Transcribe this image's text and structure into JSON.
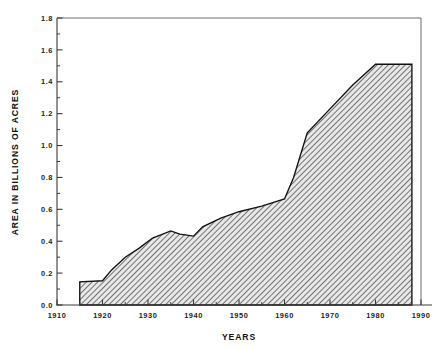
{
  "chart_data": {
    "type": "area",
    "title": "",
    "xlabel": "YEARS",
    "ylabel": "AREA IN BILLIONS OF ACRES",
    "xlim": [
      1910,
      1990
    ],
    "ylim": [
      0.0,
      1.8
    ],
    "grid": false,
    "legend": null,
    "x_ticks": [
      1910,
      1920,
      1930,
      1940,
      1950,
      1960,
      1970,
      1980,
      1990
    ],
    "x_tick_labels": [
      "1910",
      "1920",
      "1930",
      "1940",
      "1950",
      "1960",
      "1970",
      "1980",
      "1990"
    ],
    "x_minor_tick_step": 5,
    "y_ticks": [
      0.0,
      0.2,
      0.4,
      0.6,
      0.8,
      1.0,
      1.2,
      1.4,
      1.6,
      1.8
    ],
    "y_tick_labels": [
      "0.0",
      "0.2",
      "0.4",
      "0.6",
      "0.8",
      "1.0",
      "1.2",
      "1.4",
      "1.6",
      "1.8"
    ],
    "y_minor_tick_step": 0.1,
    "fill_pattern": "diagonal-hatch",
    "fill_color": "#9a9a9a",
    "line_color": "#111111",
    "x": [
      1915,
      1915,
      1920,
      1922,
      1925,
      1928,
      1931,
      1935,
      1937,
      1940,
      1942,
      1946,
      1950,
      1955,
      1960,
      1962,
      1965,
      1970,
      1975,
      1980,
      1988,
      1988
    ],
    "values": [
      0.0,
      0.145,
      0.152,
      0.22,
      0.3,
      0.355,
      0.42,
      0.465,
      0.445,
      0.432,
      0.49,
      0.545,
      0.585,
      0.62,
      0.665,
      0.8,
      1.08,
      1.23,
      1.38,
      1.51,
      1.51,
      0.0
    ],
    "series": [
      {
        "name": "area",
        "points": [
          {
            "x": 1915,
            "y": 0.0
          },
          {
            "x": 1915,
            "y": 0.145
          },
          {
            "x": 1920,
            "y": 0.152
          },
          {
            "x": 1922,
            "y": 0.22
          },
          {
            "x": 1925,
            "y": 0.3
          },
          {
            "x": 1928,
            "y": 0.355
          },
          {
            "x": 1931,
            "y": 0.42
          },
          {
            "x": 1935,
            "y": 0.465
          },
          {
            "x": 1937,
            "y": 0.445
          },
          {
            "x": 1940,
            "y": 0.432
          },
          {
            "x": 1942,
            "y": 0.49
          },
          {
            "x": 1946,
            "y": 0.545
          },
          {
            "x": 1950,
            "y": 0.585
          },
          {
            "x": 1955,
            "y": 0.62
          },
          {
            "x": 1960,
            "y": 0.665
          },
          {
            "x": 1962,
            "y": 0.8
          },
          {
            "x": 1965,
            "y": 1.08
          },
          {
            "x": 1970,
            "y": 1.23
          },
          {
            "x": 1975,
            "y": 1.38
          },
          {
            "x": 1980,
            "y": 1.51
          },
          {
            "x": 1988,
            "y": 1.51
          },
          {
            "x": 1988,
            "y": 0.0
          }
        ]
      }
    ]
  }
}
